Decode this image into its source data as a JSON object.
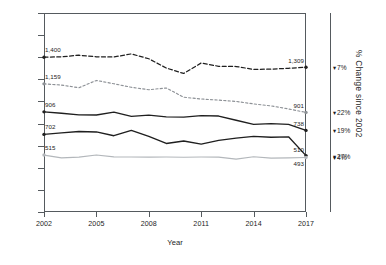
{
  "chart_data": {
    "type": "line",
    "title": "",
    "xlabel": "Year",
    "ylabel": "",
    "right_axis_label": "% Change since 2002",
    "x": [
      2002,
      2003,
      2004,
      2005,
      2006,
      2007,
      2008,
      2009,
      2010,
      2011,
      2012,
      2013,
      2014,
      2015,
      2016,
      2017
    ],
    "xlim": [
      2002,
      2017
    ],
    "ylim": [
      0,
      1800
    ],
    "grid": false,
    "legend_position": "none",
    "y_ticks": [
      "0",
      "200",
      "400",
      "600",
      "800",
      "1,000",
      "1,200",
      "1,400",
      "1,600",
      "1,800"
    ],
    "y_tick_values": [
      0,
      200,
      400,
      600,
      800,
      1000,
      1200,
      1400,
      1600,
      1800
    ],
    "x_ticks": [
      "2002",
      "2005",
      "2008",
      "2011",
      "2014",
      "2017"
    ],
    "x_tick_values": [
      2002,
      2005,
      2008,
      2011,
      2014,
      2017
    ],
    "series": [
      {
        "name": "series-1",
        "style": "dashed",
        "color": "#1f1f1f",
        "width": 1.25,
        "dash": "4,2.4",
        "start_label": "1,400",
        "end_label": "1,309",
        "change_label": "7%",
        "values": [
          1400,
          1404,
          1418,
          1404,
          1402,
          1430,
          1386,
          1302,
          1253,
          1348,
          1318,
          1316,
          1290,
          1292,
          1300,
          1309
        ]
      },
      {
        "name": "series-2",
        "style": "dotted",
        "color": "#8d9196",
        "width": 1.15,
        "dash": "2.2,2.2",
        "start_label": "1,159",
        "end_label": "901",
        "change_label": "22%",
        "values": [
          1159,
          1148,
          1124,
          1190,
          1160,
          1128,
          1106,
          1122,
          1038,
          1022,
          1012,
          1000,
          978,
          960,
          932,
          901
        ]
      },
      {
        "name": "series-3",
        "style": "solid",
        "color": "#1f1f1f",
        "width": 1.35,
        "dash": "",
        "start_label": "906",
        "end_label": "738",
        "change_label": "19%",
        "values": [
          906,
          893,
          878,
          877,
          904,
          865,
          876,
          861,
          858,
          872,
          868,
          830,
          792,
          800,
          792,
          738
        ]
      },
      {
        "name": "series-4",
        "style": "solid",
        "color": "#1f1f1f",
        "width": 1.35,
        "dash": "",
        "start_label": "702",
        "end_label": "510",
        "change_label": "27%",
        "values": [
          702,
          715,
          728,
          724,
          690,
          738,
          684,
          620,
          642,
          614,
          648,
          668,
          684,
          676,
          680,
          510
        ]
      },
      {
        "name": "series-5",
        "style": "solid",
        "color": "#b3b7bb",
        "width": 1.15,
        "dash": "",
        "start_label": "515",
        "end_label": "493",
        "change_label": "4%",
        "values": [
          515,
          490,
          496,
          516,
          498,
          497,
          496,
          497,
          495,
          497,
          496,
          478,
          500,
          487,
          490,
          493
        ]
      }
    ]
  },
  "axis": {
    "x_title": "Year",
    "y_labels": [
      "1,800",
      "1,600",
      "1,400",
      "1,200",
      "1,000",
      "800",
      "600",
      "400",
      "200",
      "0"
    ],
    "x_labels": [
      "2002",
      "2005",
      "2008",
      "2011",
      "2014",
      "2017"
    ],
    "right_title": "% Change since 2002",
    "chevron": "▾"
  },
  "labels": {
    "start": [
      "1,400",
      "1,159",
      "906",
      "702",
      "515"
    ],
    "end": [
      "1,309",
      "901",
      "738",
      "510",
      "493"
    ],
    "pct": [
      "7%",
      "22%",
      "19%",
      "27%",
      "4%"
    ]
  },
  "colors": {
    "frame": "#555a5e",
    "dark": "#1f1f1f",
    "mid_gray": "#8d9196",
    "light_gray": "#b3b7bb",
    "background": "#ffffff"
  }
}
